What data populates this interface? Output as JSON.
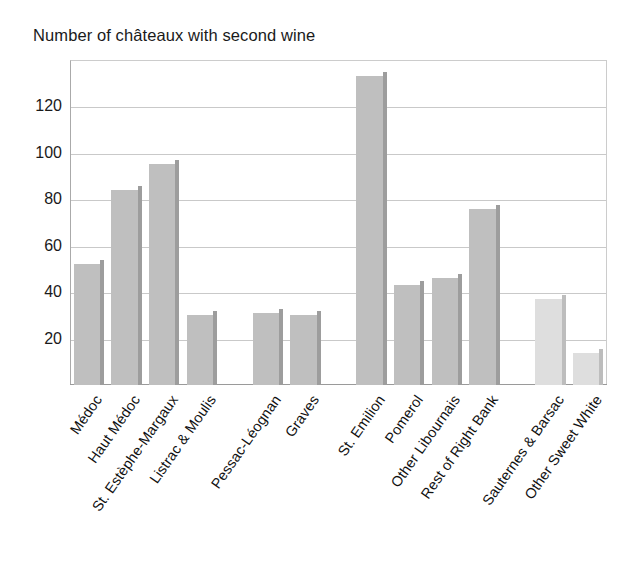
{
  "chart_data": {
    "type": "bar",
    "title": "Number of châteaux with second wine",
    "xlabel": "",
    "ylabel": "",
    "ylim": [
      0,
      140
    ],
    "yticks": [
      20,
      40,
      60,
      80,
      100,
      120
    ],
    "grid": true,
    "legend": "none",
    "categories": [
      "Médoc",
      "Haut Médoc",
      "St. Estèphe-Margaux",
      "Listrac & Moulis",
      "Pessac-Léognan",
      "Graves",
      "St. Emilion",
      "Pomerol",
      "Other Libournais",
      "Rest of Right Bank",
      "Sauternes & Barsac",
      "Other Sweet White"
    ],
    "values": [
      52,
      84,
      95,
      30,
      31,
      30,
      133,
      43,
      46,
      76,
      37,
      14
    ],
    "bar_colors": [
      "#bfbfbf",
      "#bfbfbf",
      "#bfbfbf",
      "#bfbfbf",
      "#bfbfbf",
      "#bfbfbf",
      "#bfbfbf",
      "#bfbfbf",
      "#bfbfbf",
      "#bfbfbf",
      "#dedede",
      "#dedede"
    ],
    "bar_edge_colors": [
      "#9d9d9d",
      "#9d9d9d",
      "#9d9d9d",
      "#9d9d9d",
      "#9d9d9d",
      "#9d9d9d",
      "#9d9d9d",
      "#9d9d9d",
      "#9d9d9d",
      "#9d9d9d",
      "#bdbdbd",
      "#bdbdbd"
    ],
    "group_gaps_after": [
      3,
      5,
      9
    ],
    "axis_color": "#9a9a9a",
    "grid_color": "#c9c9c9",
    "background": "#ffffff"
  }
}
